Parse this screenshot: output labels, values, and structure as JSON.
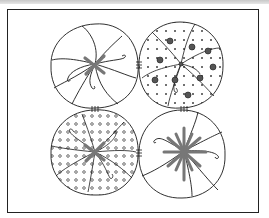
{
  "illustration": {
    "title": "Four fabric yo-yo rosettes",
    "caption": "",
    "colors": {
      "line": "#1a1a1a",
      "stitch": "#8a8a8a",
      "frame": "#222222",
      "topbar": "#cfcfcf"
    },
    "rosettes": [
      {
        "position": "top-left",
        "pattern": "plain",
        "center_stitch": "x-cross"
      },
      {
        "position": "top-right",
        "pattern": "crosses-and-dots",
        "center_stitch": "knot"
      },
      {
        "position": "bottom-left",
        "pattern": "small-circles",
        "center_stitch": "x-cross"
      },
      {
        "position": "bottom-right",
        "pattern": "plain",
        "center_stitch": "star-burst"
      }
    ]
  }
}
